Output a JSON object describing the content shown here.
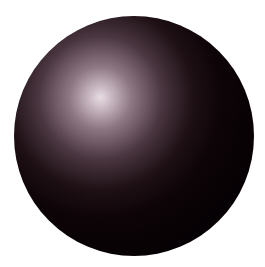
{
  "image": {
    "subject": "shaded sphere",
    "background_color": "#ffffff",
    "sphere_color": "#080305",
    "highlight_color": "#e8dde3"
  }
}
